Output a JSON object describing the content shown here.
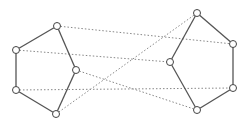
{
  "diagram": {
    "type": "graph",
    "node_radius": 3.5,
    "colors": {
      "solid_edge": "#555555",
      "dotted_edge": "#888888",
      "node_stroke": "#444444",
      "node_fill": "#ffffff"
    },
    "nodes": [
      {
        "id": "A",
        "x": 57,
        "y": 26
      },
      {
        "id": "B",
        "x": 16,
        "y": 50
      },
      {
        "id": "C",
        "x": 76,
        "y": 70
      },
      {
        "id": "D",
        "x": 16,
        "y": 90
      },
      {
        "id": "E",
        "x": 56,
        "y": 114
      },
      {
        "id": "F",
        "x": 197,
        "y": 13
      },
      {
        "id": "G",
        "x": 233,
        "y": 44
      },
      {
        "id": "H",
        "x": 170,
        "y": 62
      },
      {
        "id": "I",
        "x": 233,
        "y": 88
      },
      {
        "id": "J",
        "x": 197,
        "y": 110
      }
    ],
    "solid_edges": [
      [
        "A",
        "B"
      ],
      [
        "B",
        "D"
      ],
      [
        "D",
        "E"
      ],
      [
        "E",
        "C"
      ],
      [
        "C",
        "A"
      ],
      [
        "F",
        "G"
      ],
      [
        "G",
        "I"
      ],
      [
        "I",
        "J"
      ],
      [
        "J",
        "H"
      ],
      [
        "H",
        "F"
      ]
    ],
    "dotted_edges": [
      [
        "A",
        "G"
      ],
      [
        "B",
        "H"
      ],
      [
        "C",
        "J"
      ],
      [
        "D",
        "I"
      ],
      [
        "E",
        "F"
      ]
    ]
  }
}
